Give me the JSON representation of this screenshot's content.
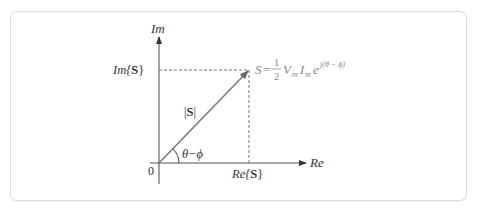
{
  "diagram": {
    "type": "phasor-diagram",
    "axes": {
      "y_label": "Im",
      "x_label": "Re",
      "origin_label": "0"
    },
    "vector": {
      "name": "S",
      "magnitude_label_pre": "|",
      "magnitude_label_bold": "S",
      "magnitude_label_post": "|",
      "angle_label": "θ−ϕ"
    },
    "projections": {
      "imag": {
        "prefix": "Im{",
        "bold": "S",
        "suffix": "}"
      },
      "real": {
        "prefix": "Re{",
        "bold": "S",
        "suffix": "}"
      }
    },
    "formula": {
      "lhs": "S",
      "equals": "=",
      "frac_num": "1",
      "frac_den": "2",
      "V": "V",
      "V_sub": "m",
      "I": "I",
      "I_sub": "m",
      "e": "e",
      "exponent": "j(θ − ϕ)"
    },
    "colors": {
      "axis": "#555555",
      "vector": "#7a7a7a",
      "dashed": "#666666",
      "formula": "#8a8a8a",
      "text": "#333333",
      "border": "#dcdcdc"
    }
  }
}
